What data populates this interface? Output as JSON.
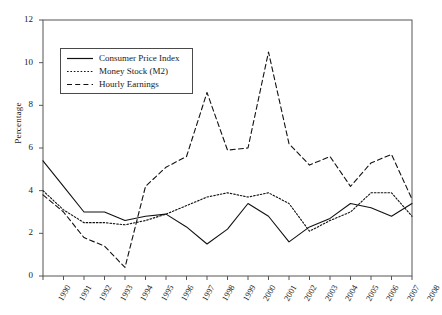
{
  "chart_data": {
    "type": "line",
    "title": "",
    "xlabel": "",
    "ylabel": "Percentage",
    "ylim": [
      0,
      12
    ],
    "yticks": [
      0,
      2,
      4,
      6,
      8,
      10,
      12
    ],
    "grid": false,
    "legend_position": "upper-left",
    "x": [
      "1990",
      "1991",
      "1992",
      "1993",
      "1994",
      "1995",
      "1996",
      "1997",
      "1998",
      "1999",
      "2000",
      "2001",
      "2002",
      "2003",
      "2004",
      "2005",
      "2006",
      "2007",
      "2008"
    ],
    "categories": [
      "1990",
      "1991",
      "1992",
      "1993",
      "1994",
      "1995",
      "1996",
      "1997",
      "1998",
      "1999",
      "2000",
      "2001",
      "2002",
      "2003",
      "2004",
      "2005",
      "2006",
      "2007",
      "2008"
    ],
    "series": [
      {
        "name": "Consumer Price Index",
        "style": "solid",
        "color": "#111111",
        "values": [
          5.4,
          4.2,
          3.0,
          3.0,
          2.6,
          2.8,
          2.9,
          2.3,
          1.5,
          2.2,
          3.4,
          2.8,
          1.6,
          2.3,
          2.7,
          3.4,
          3.2,
          2.8,
          3.4
        ]
      },
      {
        "name": "Money Stock (M2)",
        "style": "dotted",
        "color": "#111111",
        "values": [
          4.0,
          3.1,
          2.5,
          2.5,
          2.4,
          2.6,
          2.9,
          3.3,
          3.7,
          3.9,
          3.7,
          3.9,
          3.4,
          2.1,
          2.6,
          3.0,
          3.9,
          3.9,
          2.8
        ]
      },
      {
        "name": "Hourly Earnings",
        "style": "dashed",
        "color": "#111111",
        "values": [
          3.8,
          3.0,
          1.8,
          1.4,
          0.4,
          4.2,
          5.1,
          5.6,
          8.6,
          5.9,
          6.0,
          10.5,
          6.2,
          5.2,
          5.6,
          4.2,
          5.3,
          5.7,
          3.6
        ]
      }
    ]
  },
  "axes": {
    "y_tick_labels": [
      "12",
      "10",
      "8",
      "6",
      "4",
      "2",
      "0"
    ],
    "y_axis_title": "Percentage",
    "x_tick_labels": [
      "1990",
      "1991",
      "1992",
      "1993",
      "1994",
      "1995",
      "1996",
      "1997",
      "1998",
      "1999",
      "2000",
      "2001",
      "2002",
      "2003",
      "2004",
      "2005",
      "2006",
      "2007",
      "2008"
    ]
  },
  "legend": {
    "items": [
      {
        "label": "Consumer Price Index",
        "line": "solid"
      },
      {
        "label": "Money Stock (M2)",
        "line": "dotted"
      },
      {
        "label": "Hourly Earnings",
        "line": "dashed"
      }
    ]
  }
}
